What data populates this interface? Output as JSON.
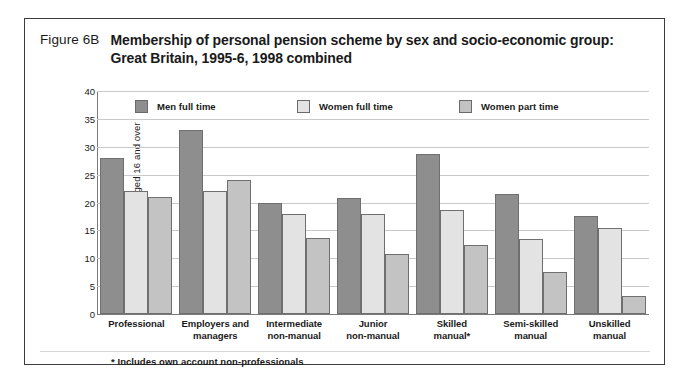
{
  "figure": {
    "number": "Figure 6B",
    "title": "Membership of personal pension scheme by sex and socio-economic group:  Great Britain, 1995-6, 1998 combined",
    "footnote": "*  Includes own account non-professionals"
  },
  "colors": {
    "series_men_full_time": "#8e8e8e",
    "series_women_full_time": "#e3e3e3",
    "series_women_part_time": "#c3c3c3",
    "axis": "#7a7a7a",
    "gridline": "#c9c9c9",
    "frame": "#3c3c3c"
  },
  "chart_data": {
    "type": "bar",
    "title": "Membership of personal pension scheme by sex and socio-economic group:  Great Britain, 1995-6, 1998 combined",
    "xlabel": "",
    "ylabel": "Percentage of employees aged 16 and over",
    "ylim": [
      0,
      40
    ],
    "yticks": [
      0,
      5,
      10,
      15,
      20,
      25,
      30,
      35,
      40
    ],
    "grid": true,
    "legend_position": "top-inside",
    "categories": [
      "Professional",
      "Employers and managers",
      "Intermediate non-manual",
      "Junior non-manual",
      "Skilled manual*",
      "Semi-skilled manual",
      "Unskilled manual"
    ],
    "category_lines": [
      [
        "Professional"
      ],
      [
        "Employers and",
        "managers"
      ],
      [
        "Intermediate",
        "non-manual"
      ],
      [
        "Junior",
        "non-manual"
      ],
      [
        "Skilled",
        "manual*"
      ],
      [
        "Semi-skilled",
        "manual"
      ],
      [
        "Unskilled",
        "manual"
      ]
    ],
    "series": [
      {
        "name": "Men full time",
        "color": "#8e8e8e",
        "values": [
          28.0,
          33.0,
          20.0,
          20.8,
          28.7,
          21.6,
          17.5
        ]
      },
      {
        "name": "Women full time",
        "color": "#e3e3e3",
        "values": [
          22.0,
          22.0,
          18.0,
          18.0,
          18.7,
          13.5,
          15.4
        ]
      },
      {
        "name": "Women part time",
        "color": "#c3c3c3",
        "values": [
          21.0,
          24.0,
          13.7,
          10.7,
          12.4,
          7.5,
          3.3
        ]
      }
    ]
  }
}
